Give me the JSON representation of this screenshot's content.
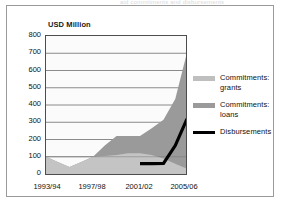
{
  "figure": {
    "clipped_top_caption": "aid commitments and disbursements",
    "title": "USD Million"
  },
  "legend": {
    "position": "right",
    "items": [
      {
        "label": "Commitments: grants",
        "swatch": "area-swatch-grants",
        "color": "#bfbfbf"
      },
      {
        "label": "Commitments: loans",
        "swatch": "area-swatch-loans",
        "color": "#9a9a9a"
      },
      {
        "label": "Disbursements",
        "swatch": "line-swatch-disbursements",
        "color": "#000000"
      }
    ]
  },
  "axes": {
    "y_ticks": [
      "800",
      "700",
      "600",
      "500",
      "400",
      "300",
      "200",
      "100",
      "0"
    ],
    "x_ticks_visible": [
      "1993/94",
      "1997/98",
      "2001/02",
      "2005/06"
    ]
  },
  "chart_data": {
    "type": "area",
    "title": "USD Million",
    "subtitle": "",
    "xlabel": "",
    "ylabel": "USD Million",
    "ylim": [
      0,
      800
    ],
    "ytick_step": 100,
    "grid": true,
    "stacked": true,
    "legend_position": "right",
    "categories": [
      "1993/94",
      "1994/95",
      "1995/96",
      "1996/97",
      "1997/98",
      "1998/99",
      "1999/00",
      "2000/01",
      "2001/02",
      "2002/03",
      "2003/04",
      "2004/05",
      "2005/06"
    ],
    "x_tick_labels": [
      "1993/94",
      "",
      "",
      "",
      "1997/98",
      "",
      "",
      "",
      "2001/02",
      "",
      "",
      "",
      "2005/06"
    ],
    "series": [
      {
        "name": "Commitments: grants",
        "type": "area",
        "color": "#bfbfbf",
        "values": [
          100,
          70,
          40,
          70,
          100,
          105,
          110,
          120,
          120,
          110,
          90,
          60,
          30
        ]
      },
      {
        "name": "Commitments: loans",
        "type": "area",
        "color": "#9a9a9a",
        "values": [
          0,
          0,
          0,
          0,
          0,
          60,
          110,
          100,
          100,
          155,
          225,
          375,
          675
        ]
      },
      {
        "name": "Disbursements",
        "type": "line",
        "color": "#000000",
        "values": [
          null,
          null,
          null,
          null,
          null,
          null,
          null,
          null,
          60,
          60,
          62,
          165,
          320
        ]
      }
    ],
    "stack_totals": [
      100,
      70,
      40,
      70,
      100,
      165,
      220,
      220,
      220,
      265,
      315,
      435,
      705
    ]
  }
}
